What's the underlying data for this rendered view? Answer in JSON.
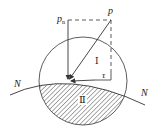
{
  "diagram": {
    "labels": {
      "p": "p",
      "pn_base": "p",
      "pn_sub": "n",
      "tau": "τ",
      "region_upper": "Ⅰ",
      "region_lower": "Ⅱ",
      "curve_left": "N",
      "curve_right": "N"
    },
    "colors": {
      "line": "#333333",
      "hatch": "#555555",
      "background": "#ffffff"
    },
    "elements": {
      "circle": {
        "cx": 83,
        "cy": 81,
        "r": 44
      },
      "vertex": {
        "x": 68,
        "y": 81
      },
      "p_point": {
        "x": 111,
        "y": 20
      },
      "pn_point": {
        "x": 68,
        "y": 20
      },
      "tau_line_end": {
        "x": 111,
        "y": 80
      }
    }
  }
}
